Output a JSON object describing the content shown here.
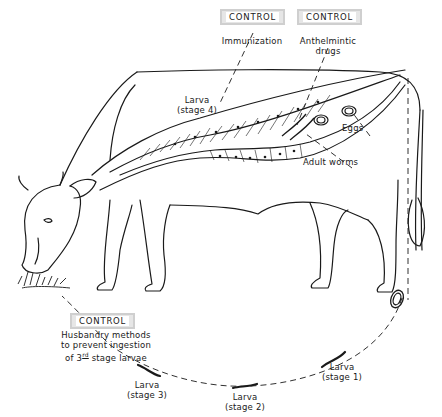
{
  "diagram": {
    "controls": [
      {
        "id": "immunization",
        "badge": "CONTROL",
        "text": "Immunization"
      },
      {
        "id": "anthelmintic",
        "badge": "CONTROL",
        "text_line1": "Anthelmintic",
        "text_line2": "drugs"
      },
      {
        "id": "husbandry",
        "badge": "CONTROL",
        "text_line1": "Husbandry methods",
        "text_line2": "to prevent ingestion",
        "text_line3_prefix": "of 3",
        "text_line3_sup": "rd",
        "text_line3_suffix": " stage larvae"
      }
    ],
    "labels": {
      "larva_stage4_line1": "Larva",
      "larva_stage4_line2": "(stage 4)",
      "eggs": "Eggs",
      "adult_worms": "Adult worms",
      "larva_stage1_line1": "Larva",
      "larva_stage1_line2": "(stage 1)",
      "larva_stage2_line1": "Larva",
      "larva_stage2_line2": "(stage 2)",
      "larva_stage3_line1": "Larva",
      "larva_stage3_line2": "(stage 3)"
    },
    "colors": {
      "ink": "#1a1a1a",
      "badge_bg": "#e6e6e6",
      "badge_border": "#cfcfcf",
      "background": "#ffffff"
    }
  }
}
